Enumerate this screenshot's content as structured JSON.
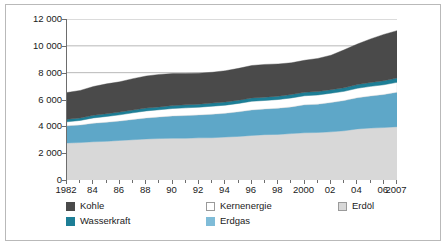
{
  "chart_data": {
    "type": "area",
    "title": "",
    "subtitle": "",
    "xlabel": "",
    "ylabel": "",
    "stacked": true,
    "grid": "horizontal",
    "legend_position": "bottom",
    "xlim": [
      1982,
      2007
    ],
    "ylim": [
      0,
      12000
    ],
    "x": [
      1982,
      1983,
      1984,
      1985,
      1986,
      1987,
      1988,
      1989,
      1990,
      1991,
      1992,
      1993,
      1994,
      1995,
      1996,
      1997,
      1998,
      1999,
      2000,
      2001,
      2002,
      2003,
      2004,
      2005,
      2006,
      2007
    ],
    "xtick_values": [
      1982,
      1984,
      1986,
      1988,
      1990,
      1992,
      1994,
      1996,
      1998,
      2000,
      2002,
      2004,
      2006,
      2007
    ],
    "xtick_labels": [
      "1982",
      "84",
      "86",
      "88",
      "90",
      "92",
      "94",
      "96",
      "98",
      "2000",
      "02",
      "04",
      "06",
      "2007"
    ],
    "ytick_values": [
      0,
      2000,
      4000,
      6000,
      8000,
      10000,
      12000
    ],
    "ytick_labels": [
      "0",
      "2 000",
      "4 000",
      "6 000",
      "8 000",
      "10 000",
      "12 000"
    ],
    "stack_order_bottom_to_top": [
      "Erdöl",
      "Erdgas",
      "Kernenergie",
      "Wasserkraft",
      "Kohle"
    ],
    "series": [
      {
        "name": "Erdöl",
        "color": "#d8d8d8",
        "values": [
          2760,
          2790,
          2850,
          2880,
          2950,
          3000,
          3060,
          3090,
          3110,
          3110,
          3140,
          3150,
          3200,
          3250,
          3320,
          3380,
          3400,
          3460,
          3520,
          3540,
          3590,
          3670,
          3810,
          3870,
          3910,
          3970
        ]
      },
      {
        "name": "Erdgas",
        "color": "#5ea7c8",
        "values": [
          1280,
          1310,
          1380,
          1420,
          1440,
          1510,
          1560,
          1610,
          1660,
          1690,
          1710,
          1750,
          1770,
          1830,
          1900,
          1910,
          1950,
          1990,
          2080,
          2110,
          2180,
          2250,
          2320,
          2390,
          2460,
          2570
        ]
      },
      {
        "name": "Kernenergie",
        "color": "#ffffff",
        "values": [
          300,
          340,
          400,
          440,
          470,
          500,
          530,
          540,
          560,
          580,
          580,
          600,
          610,
          630,
          650,
          640,
          650,
          670,
          680,
          690,
          700,
          690,
          710,
          720,
          730,
          740
        ]
      },
      {
        "name": "Wasserkraft",
        "color": "#1d7e96",
        "values": [
          180,
          185,
          190,
          195,
          200,
          205,
          210,
          210,
          215,
          220,
          220,
          230,
          235,
          240,
          245,
          245,
          250,
          255,
          255,
          250,
          260,
          265,
          275,
          285,
          300,
          320
        ]
      },
      {
        "name": "Kohle",
        "color": "#4a4a4a",
        "values": [
          2000,
          2050,
          2150,
          2230,
          2260,
          2340,
          2390,
          2420,
          2390,
          2340,
          2310,
          2300,
          2330,
          2370,
          2420,
          2440,
          2400,
          2360,
          2390,
          2470,
          2570,
          2830,
          3020,
          3250,
          3450,
          3530
        ]
      }
    ],
    "totals": [
      6520,
      6675,
      6970,
      7165,
      7320,
      7555,
      7750,
      7870,
      7935,
      7940,
      7960,
      8030,
      8145,
      8320,
      8535,
      8615,
      8650,
      8735,
      8925,
      9060,
      9300,
      9705,
      10135,
      10515,
      10850,
      11130
    ]
  },
  "legend": {
    "items": [
      {
        "label": "Kohle",
        "color": "#4a4a4a",
        "border": "#4a4a4a"
      },
      {
        "label": "Kernenergie",
        "color": "#ffffff",
        "border": "#9a9a9a"
      },
      {
        "label": "Erdöl",
        "color": "#d8d8d8",
        "border": "#9a9a9a"
      },
      {
        "label": "Wasserkraft",
        "color": "#1d7e96",
        "border": "#1d7e96"
      },
      {
        "label": "Erdgas",
        "color": "#7fbcd8",
        "border": "#7fbcd8"
      }
    ]
  },
  "colors": {
    "axis": "#6d6d6d",
    "grid": "#9a9a9a",
    "frame": "#b9b9b9",
    "text": "#1a1a1a",
    "background": "#ffffff"
  }
}
